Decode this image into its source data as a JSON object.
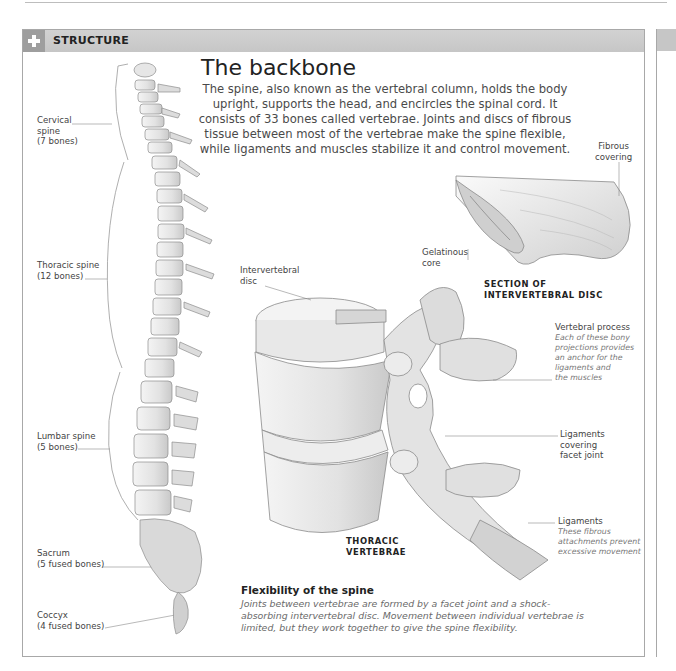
{
  "section": {
    "header_label": "STRUCTURE",
    "header_icon": "plus-icon"
  },
  "main": {
    "title": "The backbone",
    "intro": "The spine, also known as the vertebral column, holds the body upright, supports the head, and encircles the spinal cord. It consists of 33 bones called vertebrae. Joints and discs of fibrous tissue between most of the vertebrae make the spine flexible, while ligaments and muscles stabilize it and control movement."
  },
  "spine_labels": [
    {
      "name": "Cervical",
      "line2": "spine",
      "line3": "(7 bones)"
    },
    {
      "name": "Thoracic spine",
      "line2": "(12 bones)"
    },
    {
      "name": "Lumbar spine",
      "line2": "(5 bones)"
    },
    {
      "name": "Sacrum",
      "line2": "(5 fused bones)"
    },
    {
      "name": "Coccyx",
      "line2": "(4 fused bones)"
    }
  ],
  "disc_section": {
    "fibrous_label_1": "Fibrous",
    "fibrous_label_2": "covering",
    "gelatinous_label_1": "Gelatinous",
    "gelatinous_label_2": "core",
    "caption_1": "SECTION OF",
    "caption_2": "INTERVERTEBRAL DISC"
  },
  "thoracic": {
    "disc_label_1": "Intervertebral",
    "disc_label_2": "disc",
    "caption_1": "THORACIC",
    "caption_2": "VERTEBRAE",
    "process_title": "Vertebral process",
    "process_desc": [
      "Each of these bony",
      "projections provides",
      "an anchor for the",
      "ligaments and",
      "the muscles"
    ],
    "facet_label": [
      "Ligaments",
      "covering",
      "facet joint"
    ],
    "ligaments_title": "Ligaments",
    "ligaments_desc": [
      "These fibrous",
      "attachments prevent",
      "excessive movement"
    ]
  },
  "flexibility": {
    "title": "Flexibility of the spine",
    "text": "Joints between vertebrae are formed by a facet joint and a shock-absorbing intervertebral disc. Movement between individual vertebrae is limited, but they work together to give the spine flexibility."
  }
}
